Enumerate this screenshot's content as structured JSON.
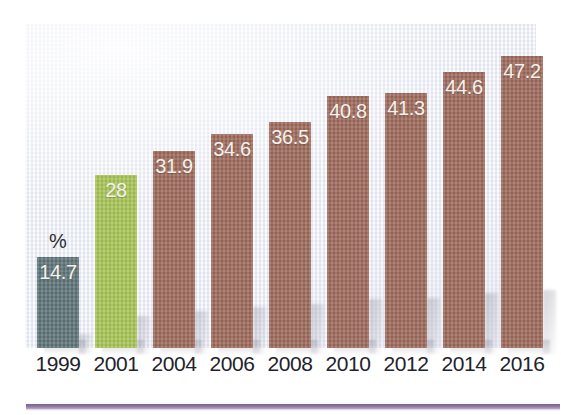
{
  "chart_data": {
    "type": "bar",
    "title": "",
    "subtitle": "",
    "xlabel": "",
    "ylabel": "%",
    "unit_label": "%",
    "categories": [
      "1999",
      "2001",
      "2004",
      "2006",
      "2008",
      "2010",
      "2012",
      "2014",
      "2016"
    ],
    "values": [
      14.7,
      28,
      31.9,
      34.6,
      36.5,
      40.8,
      41.3,
      44.6,
      47.2
    ],
    "value_labels": [
      "14.7",
      "28",
      "31.9",
      "34.6",
      "36.5",
      "40.8",
      "41.3",
      "44.6",
      "47.2"
    ],
    "bar_colors": [
      "#5e7478",
      "#a8c456",
      "#9d6a5b",
      "#9d6a5b",
      "#9d6a5b",
      "#9d6a5b",
      "#9d6a5b",
      "#9d6a5b",
      "#9d6a5b"
    ],
    "ylim": [
      0,
      52
    ],
    "grid": false,
    "legend": null,
    "legend_position": "none",
    "value_label_color": "#f4f1ec",
    "tick_label_color": "#22222a"
  },
  "palette": {
    "bar_slate": "#5e7478",
    "bar_green": "#a8c456",
    "bar_brown": "#9d6a5b",
    "panel_background": "#eceef6",
    "page_background": "#ffffff",
    "rule_purple": "#7d5f92",
    "axis_text": "#22222a",
    "value_text": "#f4f1ec"
  },
  "bars": [
    {
      "year": "1999",
      "label": "14.7",
      "value": 14.7,
      "color": "#5e7478",
      "x": 12,
      "width": 42,
      "height": 91
    },
    {
      "year": "2001",
      "label": "28",
      "value": 28,
      "color": "#a8c456",
      "x": 70,
      "width": 42,
      "height": 173
    },
    {
      "year": "2004",
      "label": "31.9",
      "value": 31.9,
      "color": "#9d6a5b",
      "x": 128,
      "width": 42,
      "height": 197
    },
    {
      "year": "2006",
      "label": "34.6",
      "value": 34.6,
      "color": "#9d6a5b",
      "x": 186,
      "width": 42,
      "height": 214
    },
    {
      "year": "2008",
      "label": "36.5",
      "value": 36.5,
      "color": "#9d6a5b",
      "x": 244,
      "width": 42,
      "height": 226
    },
    {
      "year": "2010",
      "label": "40.8",
      "value": 40.8,
      "color": "#9d6a5b",
      "x": 302,
      "width": 42,
      "height": 252
    },
    {
      "year": "2012",
      "label": "41.3",
      "value": 41.3,
      "color": "#9d6a5b",
      "x": 360,
      "width": 42,
      "height": 255
    },
    {
      "year": "2014",
      "label": "44.6",
      "value": 44.6,
      "color": "#9d6a5b",
      "x": 418,
      "width": 42,
      "height": 276
    },
    {
      "year": "2016",
      "label": "47.2",
      "value": 47.2,
      "color": "#9d6a5b",
      "x": 476,
      "width": 42,
      "height": 292
    }
  ]
}
